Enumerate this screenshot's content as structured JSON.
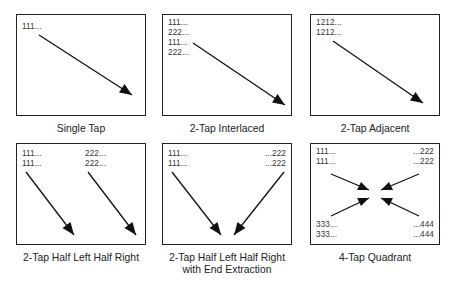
{
  "figure": {
    "panels": [
      {
        "caption": "Single Tap",
        "labels": [
          "111..."
        ]
      },
      {
        "caption": "2-Tap Interlaced",
        "labels": [
          "111...",
          "222...",
          "111...",
          "222..."
        ]
      },
      {
        "caption": "2-Tap Adjacent",
        "labels": [
          "1212...",
          "1212..."
        ]
      },
      {
        "caption": "2-Tap Half Left Half Right",
        "labels_left": [
          "111...",
          "111..."
        ],
        "labels_right": [
          "222...",
          "222..."
        ]
      },
      {
        "caption_line1": "2-Tap Half Left Half Right",
        "caption_line2": "with End Extraction",
        "labels_left": [
          "111...",
          "111..."
        ],
        "labels_right": [
          "...222",
          "...222"
        ]
      },
      {
        "caption": "4-Tap Quadrant",
        "labels_top_left": [
          "111...",
          "111..."
        ],
        "labels_top_right": [
          "...222",
          "...222"
        ],
        "labels_bottom_left": [
          "333...",
          "333..."
        ],
        "labels_bottom_right": [
          "...444",
          "...444"
        ]
      }
    ]
  }
}
